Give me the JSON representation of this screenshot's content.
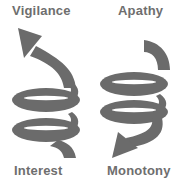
{
  "diagram": {
    "left_spiral": {
      "top_label": "Vigilance",
      "bottom_label": "Interest",
      "direction": "upward",
      "icon": "spiral-arrow-up-icon"
    },
    "right_spiral": {
      "top_label": "Apathy",
      "bottom_label": "Monotony",
      "direction": "downward",
      "icon": "spiral-arrow-down-icon"
    },
    "colors": {
      "spiral": "#6b6b6b",
      "spiral_dark": "#5a5a5a",
      "label": "#6e6e6e",
      "background": "#ffffff"
    }
  }
}
